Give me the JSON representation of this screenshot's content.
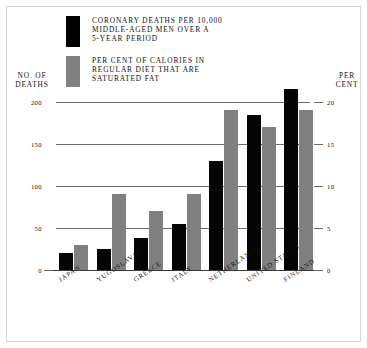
{
  "chart_data": {
    "type": "bar",
    "title": "",
    "categories": [
      "JAPAN",
      "YUGOSLAVIA",
      "GREECE",
      "ITALY",
      "NETHERLANDS",
      "UNITED STATES",
      "FINLAND"
    ],
    "series": [
      {
        "name": "CORONARY DEATHS PER 10,000 MIDDLE-AGED MEN OVER A 5-YEAR PERIOD",
        "short_name": "coronary-deaths",
        "axis": "left",
        "color": "#050505",
        "values": [
          20,
          25,
          38,
          55,
          130,
          185,
          215
        ]
      },
      {
        "name": "PER CENT OF CALORIES IN REGULAR DIET THAT ARE SATURATED FAT",
        "short_name": "saturated-fat-percent",
        "axis": "right",
        "color": "#808080",
        "values": [
          3,
          9,
          7,
          9,
          19,
          17,
          19
        ]
      }
    ],
    "xlabel": "",
    "ylabel": "NO. OF DEATHS",
    "y2label": "PER CENT",
    "ylim": [
      0,
      200
    ],
    "y2lim": [
      0,
      20
    ],
    "yticks": [
      0,
      50,
      100,
      150,
      200
    ],
    "y2ticks": [
      0,
      5,
      10,
      15,
      20
    ],
    "grid": true,
    "legend_position": "top-left"
  },
  "legend": {
    "items": [
      {
        "swatch": "black",
        "lines": [
          "CORONARY DEATHS PER 10,000",
          "MIDDLE-AGED MEN OVER A",
          "5-YEAR PERIOD"
        ]
      },
      {
        "swatch": "gray",
        "lines": [
          "PER CENT OF CALORIES IN",
          "REGULAR DIET THAT ARE",
          "SATURATED FAT"
        ]
      }
    ]
  },
  "axes": {
    "left": {
      "line1": "NO. OF",
      "line2": "DEATHS"
    },
    "right": {
      "line1": "PER",
      "line2": "CENT"
    }
  },
  "colors": {
    "black_bar": "#050505",
    "gray_bar": "#808080",
    "gridline": "#6b6b6b",
    "background": "#ffffff"
  }
}
